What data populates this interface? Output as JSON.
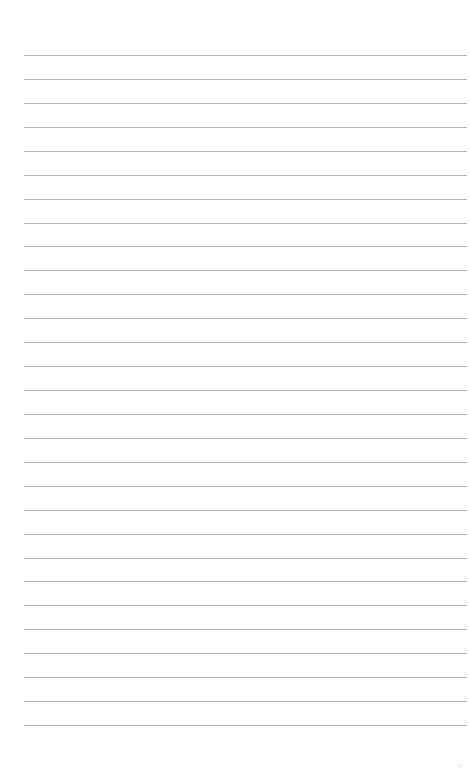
{
  "page": {
    "type": "lined-paper",
    "background_color": "#ffffff",
    "line_color": "#b4b4b4",
    "line_count": 29,
    "first_line_y": 55,
    "line_spacing": 23.93,
    "line_left_x": 24,
    "line_right_x": 467,
    "text": []
  }
}
